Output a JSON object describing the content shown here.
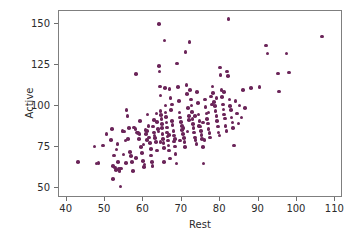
{
  "chart_data": {
    "type": "scatter",
    "title": "",
    "xlabel": "Rest",
    "ylabel": "Active",
    "xlim": [
      38,
      112
    ],
    "ylim": [
      44,
      158
    ],
    "xticks": [
      40,
      50,
      60,
      70,
      80,
      90,
      100,
      110
    ],
    "yticks": [
      50,
      75,
      100,
      125,
      150
    ],
    "xticklabels": [
      "40",
      "50",
      "60",
      "70",
      "80",
      "90",
      "100",
      "110"
    ],
    "yticklabels": [
      "50",
      "75",
      "100",
      "125",
      "150"
    ],
    "grid": false,
    "legend": null,
    "marker": {
      "shape": "circle",
      "color": "#6B2559",
      "size": 3.6
    },
    "n_points": 216,
    "points": [
      [
        43.0,
        66.0
      ],
      [
        47.2,
        75.5
      ],
      [
        47.8,
        65.0
      ],
      [
        48.3,
        65.5
      ],
      [
        49.5,
        76.0
      ],
      [
        50.4,
        83.0
      ],
      [
        51.5,
        79.5
      ],
      [
        51.8,
        86.0
      ],
      [
        52.0,
        63.5
      ],
      [
        52.1,
        55.5
      ],
      [
        52.4,
        70.0
      ],
      [
        52.6,
        62.5
      ],
      [
        52.9,
        61.0
      ],
      [
        53.2,
        77.0
      ],
      [
        53.4,
        66.0
      ],
      [
        53.6,
        61.5
      ],
      [
        53.8,
        60.5
      ],
      [
        54.0,
        51.0
      ],
      [
        54.2,
        62.0
      ],
      [
        54.5,
        85.0
      ],
      [
        54.8,
        70.5
      ],
      [
        55.0,
        84.5
      ],
      [
        55.3,
        79.0
      ],
      [
        55.6,
        97.5
      ],
      [
        55.9,
        94.0
      ],
      [
        56.2,
        86.5
      ],
      [
        56.5,
        72.0
      ],
      [
        56.8,
        69.5
      ],
      [
        57.0,
        66.0
      ],
      [
        57.3,
        60.5
      ],
      [
        57.6,
        87.0
      ],
      [
        57.9,
        86.0
      ],
      [
        58.1,
        119.5
      ],
      [
        58.3,
        84.0
      ],
      [
        58.6,
        83.5
      ],
      [
        58.9,
        80.0
      ],
      [
        59.1,
        91.0
      ],
      [
        59.4,
        75.0
      ],
      [
        59.7,
        71.5
      ],
      [
        59.9,
        66.5
      ],
      [
        60.1,
        63.0
      ],
      [
        60.3,
        64.5
      ],
      [
        60.5,
        85.5
      ],
      [
        60.7,
        83.0
      ],
      [
        60.9,
        79.5
      ],
      [
        61.1,
        95.0
      ],
      [
        61.3,
        88.0
      ],
      [
        61.5,
        81.0
      ],
      [
        61.7,
        77.5
      ],
      [
        61.9,
        74.0
      ],
      [
        62.0,
        70.0
      ],
      [
        62.2,
        66.0
      ],
      [
        62.4,
        63.5
      ],
      [
        62.5,
        87.5
      ],
      [
        62.7,
        84.0
      ],
      [
        62.9,
        82.0
      ],
      [
        63.0,
        80.5
      ],
      [
        63.2,
        78.0
      ],
      [
        63.4,
        95.5
      ],
      [
        63.6,
        90.5
      ],
      [
        63.8,
        86.0
      ],
      [
        63.9,
        84.5
      ],
      [
        64.0,
        150.0
      ],
      [
        64.1,
        124.5
      ],
      [
        64.2,
        121.0
      ],
      [
        64.3,
        112.0
      ],
      [
        64.4,
        106.5
      ],
      [
        64.5,
        97.0
      ],
      [
        64.6,
        94.5
      ],
      [
        64.7,
        92.0
      ],
      [
        64.8,
        89.0
      ],
      [
        64.9,
        86.5
      ],
      [
        65.0,
        83.0
      ],
      [
        65.1,
        80.0
      ],
      [
        65.2,
        77.5
      ],
      [
        65.3,
        74.5
      ],
      [
        65.4,
        66.0
      ],
      [
        65.5,
        140.0
      ],
      [
        65.6,
        111.0
      ],
      [
        65.7,
        100.5
      ],
      [
        65.8,
        96.0
      ],
      [
        65.9,
        93.5
      ],
      [
        66.0,
        90.0
      ],
      [
        66.1,
        87.0
      ],
      [
        66.2,
        84.0
      ],
      [
        66.3,
        81.5
      ],
      [
        66.4,
        79.0
      ],
      [
        66.5,
        76.0
      ],
      [
        66.7,
        73.0
      ],
      [
        66.9,
        68.0
      ],
      [
        67.0,
        105.0
      ],
      [
        67.2,
        97.5
      ],
      [
        67.4,
        91.0
      ],
      [
        67.6,
        88.5
      ],
      [
        67.8,
        85.0
      ],
      [
        67.9,
        82.0
      ],
      [
        68.0,
        78.5
      ],
      [
        68.2,
        75.5
      ],
      [
        68.4,
        71.0
      ],
      [
        68.6,
        65.0
      ],
      [
        68.8,
        126.0
      ],
      [
        69.0,
        111.5
      ],
      [
        69.2,
        103.0
      ],
      [
        69.4,
        96.0
      ],
      [
        69.6,
        93.0
      ],
      [
        69.8,
        90.5
      ],
      [
        70.0,
        88.0
      ],
      [
        70.1,
        85.5
      ],
      [
        70.3,
        83.0
      ],
      [
        70.5,
        80.5
      ],
      [
        70.7,
        78.0
      ],
      [
        70.9,
        75.0
      ],
      [
        71.0,
        133.0
      ],
      [
        71.2,
        113.0
      ],
      [
        71.4,
        107.5
      ],
      [
        71.6,
        99.0
      ],
      [
        71.8,
        94.0
      ],
      [
        71.9,
        91.5
      ],
      [
        72.0,
        139.0
      ],
      [
        72.2,
        110.0
      ],
      [
        72.4,
        104.0
      ],
      [
        72.6,
        96.5
      ],
      [
        72.8,
        92.0
      ],
      [
        72.9,
        89.0
      ],
      [
        73.0,
        86.5
      ],
      [
        73.2,
        84.0
      ],
      [
        73.4,
        81.0
      ],
      [
        73.6,
        79.5
      ],
      [
        73.8,
        77.0
      ],
      [
        74.0,
        108.5
      ],
      [
        74.2,
        102.0
      ],
      [
        74.4,
        95.0
      ],
      [
        74.6,
        91.0
      ],
      [
        74.8,
        87.5
      ],
      [
        75.0,
        85.0
      ],
      [
        75.1,
        82.5
      ],
      [
        75.3,
        80.0
      ],
      [
        75.5,
        75.0
      ],
      [
        75.7,
        65.0
      ],
      [
        75.9,
        79.5
      ],
      [
        76.0,
        104.0
      ],
      [
        76.2,
        99.5
      ],
      [
        76.4,
        95.5
      ],
      [
        76.6,
        92.0
      ],
      [
        76.8,
        89.5
      ],
      [
        77.0,
        86.0
      ],
      [
        77.2,
        83.5
      ],
      [
        77.4,
        81.0
      ],
      [
        77.6,
        106.0
      ],
      [
        77.8,
        101.0
      ],
      [
        78.0,
        112.0
      ],
      [
        78.2,
        108.0
      ],
      [
        78.4,
        102.5
      ],
      [
        78.6,
        100.0
      ],
      [
        78.8,
        97.0
      ],
      [
        79.0,
        94.0
      ],
      [
        79.2,
        91.0
      ],
      [
        79.4,
        87.5
      ],
      [
        79.6,
        84.0
      ],
      [
        79.8,
        82.0
      ],
      [
        80.0,
        123.5
      ],
      [
        80.1,
        119.0
      ],
      [
        80.3,
        110.0
      ],
      [
        80.5,
        105.5
      ],
      [
        80.7,
        101.0
      ],
      [
        80.9,
        98.0
      ],
      [
        81.0,
        95.0
      ],
      [
        81.2,
        92.5
      ],
      [
        81.4,
        88.0
      ],
      [
        81.6,
        85.0
      ],
      [
        81.8,
        121.0
      ],
      [
        82.0,
        118.5
      ],
      [
        82.2,
        153.0
      ],
      [
        82.4,
        104.0
      ],
      [
        82.6,
        100.0
      ],
      [
        82.8,
        97.5
      ],
      [
        83.0,
        93.0
      ],
      [
        83.2,
        90.0
      ],
      [
        83.4,
        86.5
      ],
      [
        83.6,
        76.0
      ],
      [
        84.0,
        103.0
      ],
      [
        84.4,
        95.5
      ],
      [
        84.8,
        89.5
      ],
      [
        85.0,
        100.5
      ],
      [
        85.5,
        93.0
      ],
      [
        86.0,
        110.0
      ],
      [
        86.5,
        99.0
      ],
      [
        88.0,
        111.0
      ],
      [
        90.2,
        111.5
      ],
      [
        92.0,
        137.0
      ],
      [
        92.3,
        132.0
      ],
      [
        95.0,
        120.0
      ],
      [
        95.4,
        109.0
      ],
      [
        97.3,
        132.0
      ],
      [
        98.0,
        120.5
      ],
      [
        106.5,
        142.5
      ],
      [
        62.8,
        91.5
      ],
      [
        66.6,
        82.5
      ],
      [
        70.4,
        86.5
      ],
      [
        74.5,
        88.0
      ],
      [
        68.3,
        80.0
      ],
      [
        64.5,
        78.0
      ],
      [
        71.5,
        84.5
      ],
      [
        73.5,
        94.0
      ],
      [
        60.0,
        76.5
      ],
      [
        58.0,
        68.5
      ],
      [
        56.0,
        80.0
      ],
      [
        77.0,
        96.0
      ],
      [
        67.5,
        101.0
      ],
      [
        69.5,
        79.0
      ],
      [
        63.5,
        73.0
      ],
      [
        75.5,
        90.0
      ],
      [
        79.0,
        105.0
      ],
      [
        81.0,
        108.5
      ],
      [
        72.5,
        100.5
      ],
      [
        66.8,
        110.5
      ],
      [
        61.0,
        85.0
      ],
      [
        59.0,
        83.0
      ],
      [
        53.0,
        73.5
      ],
      [
        55.5,
        65.5
      ]
    ]
  }
}
